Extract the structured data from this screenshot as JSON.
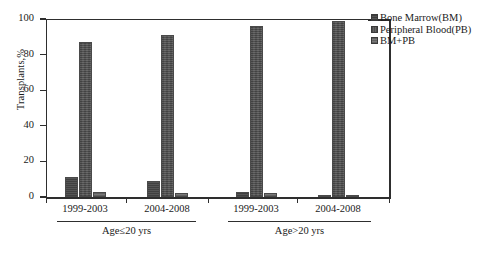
{
  "chart_data": {
    "type": "bar",
    "title": "",
    "subtitle": "",
    "xlabel": "",
    "ylabel": "Transplants,%",
    "ylim": [
      0,
      100
    ],
    "yticks": [
      0,
      20,
      40,
      60,
      80,
      100
    ],
    "ytick_labels": [
      "0",
      "20",
      "40",
      "60",
      "80",
      "100"
    ],
    "grid": false,
    "legend_position": "right",
    "categories": [
      "1999-2003",
      "2004-2008",
      "1999-2003",
      "2004-2008"
    ],
    "groups": [
      {
        "label": "Age≤20 yrs",
        "categories": [
          "1999-2003",
          "2004-2008"
        ]
      },
      {
        "label": "Age>20 yrs",
        "categories": [
          "1999-2003",
          "2004-2008"
        ]
      }
    ],
    "series": [
      {
        "name": "Bone Marrow(BM)",
        "key": "bm",
        "color": "#4c4c4c",
        "values": [
          11,
          9,
          3,
          1
        ]
      },
      {
        "name": "Peripheral Blood(PB)",
        "key": "pb",
        "color": "#5a5a5a",
        "values": [
          87,
          91,
          96,
          99
        ]
      },
      {
        "name": "BM+PB",
        "key": "bmpb",
        "color": "#6e6e6e",
        "values": [
          3,
          2,
          2,
          1
        ]
      }
    ]
  },
  "legend": {
    "items": [
      {
        "label": "Bone Marrow(BM)",
        "swatch": "bm"
      },
      {
        "label": "Peripheral Blood(PB)",
        "swatch": "pb"
      },
      {
        "label": "BM+PB",
        "swatch": "bmpb"
      }
    ]
  },
  "axes": {
    "y_title": "Transplants,%",
    "y_tick_labels": [
      "100",
      "80",
      "60",
      "40",
      "20",
      "0"
    ],
    "x_tick_labels": [
      "1999-2003",
      "2004-2008",
      "1999-2003",
      "2004-2008"
    ],
    "group_labels": [
      "Age≤20 yrs",
      "Age>20 yrs"
    ]
  }
}
